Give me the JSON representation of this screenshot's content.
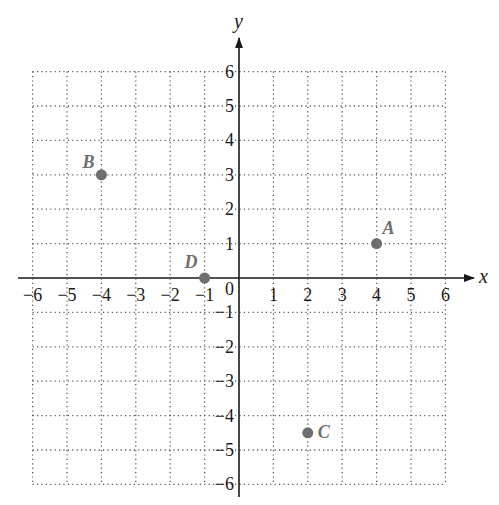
{
  "chart_data": {
    "type": "scatter",
    "title": "",
    "xlabel": "x",
    "ylabel": "y",
    "xlim": [
      -6,
      6
    ],
    "ylim": [
      -6,
      6
    ],
    "grid": true,
    "x_ticks": [
      "−6",
      "−5",
      "−4",
      "−3",
      "−2",
      "−1",
      "1",
      "2",
      "3",
      "4",
      "5",
      "6"
    ],
    "y_ticks": [
      "6",
      "5",
      "4",
      "3",
      "2",
      "1",
      "−1",
      "−2",
      "−3",
      "−4",
      "−5",
      "−6"
    ],
    "origin_label": "0",
    "points": [
      {
        "label": "A",
        "x": 4,
        "y": 1
      },
      {
        "label": "B",
        "x": -4,
        "y": 3
      },
      {
        "label": "C",
        "x": 2,
        "y": -4.5
      },
      {
        "label": "D",
        "x": -1,
        "y": 0
      }
    ],
    "colors": {
      "point": "#6e6e6e",
      "axis": "#1a1a1a",
      "grid": "#555555"
    }
  }
}
